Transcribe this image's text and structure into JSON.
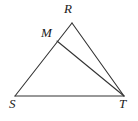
{
  "figure": {
    "kind": "geometry-diagram",
    "background_color": "#ffffff",
    "stroke_color": "#333333",
    "label_color": "#1a1a1a",
    "stroke_width": 1.1,
    "canvas": {
      "width": 138,
      "height": 121
    }
  },
  "points": {
    "R": {
      "label": "R",
      "x": 72,
      "y": 23,
      "label_x": 64,
      "label_y": 2
    },
    "M": {
      "label": "M",
      "x": 57,
      "y": 41,
      "label_x": 41,
      "label_y": 26
    },
    "S": {
      "label": "S",
      "x": 15,
      "y": 96,
      "label_x": 9,
      "label_y": 97
    },
    "T": {
      "label": "T",
      "x": 124,
      "y": 96,
      "label_x": 119,
      "label_y": 97
    }
  },
  "segments": [
    {
      "name": "side-SR",
      "from": "S",
      "to": "R",
      "x1": 15,
      "y1": 96,
      "x2": 72,
      "y2": 23
    },
    {
      "name": "side-ST",
      "from": "S",
      "to": "T",
      "x1": 15,
      "y1": 96,
      "x2": 124,
      "y2": 96
    },
    {
      "name": "side-RT",
      "from": "R",
      "to": "T",
      "x1": 72,
      "y1": 23,
      "x2": 124,
      "y2": 96
    },
    {
      "name": "cevian-MT",
      "from": "M",
      "to": "T",
      "x1": 57,
      "y1": 41,
      "x2": 124,
      "y2": 96
    }
  ]
}
